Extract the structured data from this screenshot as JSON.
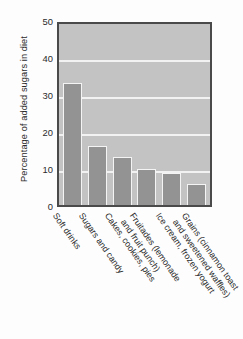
{
  "chart_data": {
    "type": "bar",
    "title": "",
    "xlabel": "",
    "ylabel": "Percentage of added sugars in diet",
    "ylim": [
      0,
      50
    ],
    "yticks": [
      50,
      40,
      30,
      20,
      10,
      0
    ],
    "grid": "horizontal gridlines at 10, 20, 30, 40",
    "legend": "none",
    "orientation": "vertical",
    "categories": [
      "Soft drinks",
      "Sugars and candy",
      "Cakes, cookies, pies",
      "Fruitades (lemonade\nand fruit punch)",
      "Ice cream, frozen yogurt",
      "Grains (cinnamon toast\nand sweetened waffles)"
    ],
    "values": [
      33,
      16,
      13,
      9.7,
      8.6,
      5.7
    ],
    "colors": {
      "bar_fill": "#939393",
      "bar_outline": "#f4f4f4",
      "plot_background": "#c3c3c3",
      "gridline": "#f2f2f2",
      "axis_border": "#4a4a4a",
      "text": "#2b2b2b",
      "page_background": "#fdfdfd"
    }
  }
}
